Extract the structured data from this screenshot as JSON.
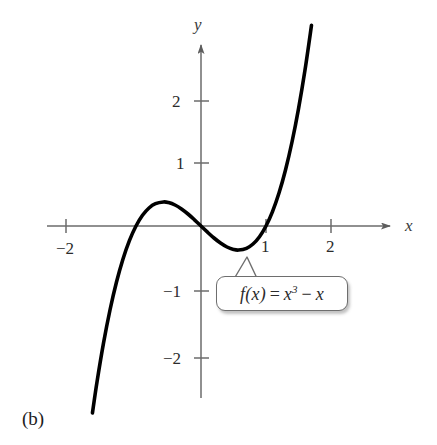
{
  "figure": {
    "caption": "(b)",
    "background_color": "#ffffff"
  },
  "chart_data": {
    "type": "line",
    "title": "",
    "subtitle": "",
    "xlabel": "x",
    "ylabel": "y",
    "function_expression": "f(x) = x^3 - x",
    "annotations": [
      {
        "name": "function-callout",
        "text": "f(x) = x³ − x",
        "text_parts": {
          "lhs": "f(x)",
          "equals": "=",
          "base": "x",
          "exponent": "3",
          "minus": "−",
          "term": "x"
        },
        "points_to_x": 0.577,
        "points_to_y": -0.385
      }
    ],
    "xlim": [
      -2.6,
      2.9
    ],
    "ylim": [
      -2.6,
      2.9
    ],
    "xticks": [
      -2,
      1,
      2
    ],
    "yticks": [
      2,
      1,
      -1,
      -2
    ],
    "xtick_labels": [
      "−2",
      "1",
      "2"
    ],
    "ytick_labels": [
      "2",
      "1",
      "−1",
      "−2"
    ],
    "grid": false,
    "legend": "none",
    "axis_color": "#666666",
    "curve_color": "#000000",
    "x_domain_drawn": [
      -1.67,
      1.7
    ],
    "roots": [
      -1,
      0,
      1
    ],
    "local_maximum": {
      "x": -0.577,
      "y": 0.385
    },
    "local_minimum": {
      "x": 0.577,
      "y": -0.385
    },
    "series": [
      {
        "name": "f(x) = x^3 - x",
        "x": [
          -1.67,
          -1.6,
          -1.5,
          -1.4,
          -1.3,
          -1.2,
          -1.1,
          -1.0,
          -0.9,
          -0.8,
          -0.7,
          -0.577,
          -0.5,
          -0.4,
          -0.3,
          -0.2,
          -0.1,
          0.0,
          0.1,
          0.2,
          0.3,
          0.4,
          0.5,
          0.577,
          0.7,
          0.8,
          0.9,
          1.0,
          1.1,
          1.2,
          1.3,
          1.4,
          1.5,
          1.6,
          1.7
        ],
        "y": [
          -2.99,
          -2.496,
          -1.875,
          -1.344,
          -0.897,
          -0.528,
          -0.231,
          0.0,
          0.171,
          0.288,
          0.357,
          0.385,
          0.375,
          0.336,
          0.273,
          0.192,
          0.099,
          0.0,
          -0.099,
          -0.192,
          -0.273,
          -0.336,
          -0.375,
          -0.385,
          -0.357,
          -0.288,
          -0.171,
          0.0,
          0.231,
          0.528,
          0.897,
          1.344,
          1.875,
          2.496,
          3.213
        ]
      }
    ]
  },
  "axes": {
    "y_axis_label": "y",
    "x_axis_label": "x"
  }
}
